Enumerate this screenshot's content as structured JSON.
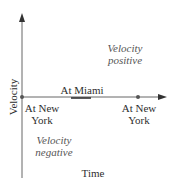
{
  "diagram": {
    "axes": {
      "x_label": "Time",
      "y_label": "Velocity"
    },
    "points": [
      {
        "label_line1": "At New",
        "label_line2": "York",
        "position": "origin"
      },
      {
        "label": "At Miami",
        "position": "middle"
      },
      {
        "label_line1": "At New",
        "label_line2": "York",
        "position": "end"
      }
    ],
    "regions": {
      "positive": {
        "line1": "Velocity",
        "line2": "positive"
      },
      "negative": {
        "line1": "Velocity",
        "line2": "negative"
      }
    },
    "colors": {
      "axis": "#555555",
      "highlight_segment": "#333333"
    }
  }
}
